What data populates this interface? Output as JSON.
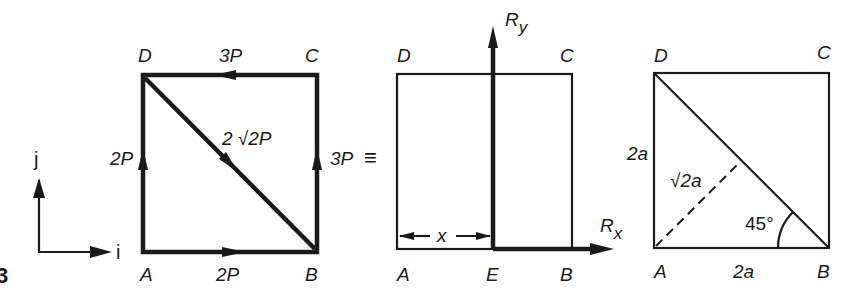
{
  "figure": {
    "fig_number_fragment": "3",
    "axes": {
      "x_label": "i",
      "y_label": "j"
    },
    "panel1": {
      "vertices": {
        "A": "A",
        "B": "B",
        "C": "C",
        "D": "D"
      },
      "forces": {
        "AB": "2P",
        "AD": "2P",
        "BC": "3P",
        "CD": "3P",
        "DB": "2 √2P"
      }
    },
    "equiv_symbol": "≡",
    "panel2": {
      "vertices": {
        "A": "A",
        "B": "B",
        "C": "C",
        "D": "D",
        "E": "E"
      },
      "resultants": {
        "Rx": "R",
        "Rx_sub": "x",
        "Ry": "R",
        "Ry_sub": "y"
      },
      "distance_label": "x"
    },
    "panel3": {
      "vertices": {
        "A": "A",
        "B": "B",
        "C": "C",
        "D": "D"
      },
      "side_left": "2a",
      "side_bottom": "2a",
      "perpendicular": "√2a",
      "angle": "45°"
    }
  }
}
